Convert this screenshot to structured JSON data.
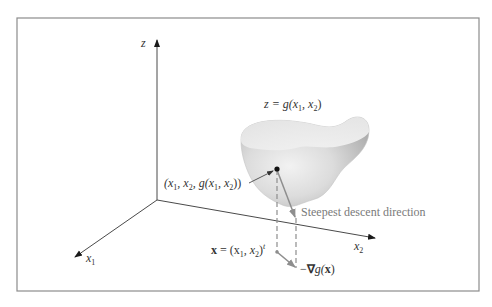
{
  "figure": {
    "frame_color": "#8c8c8c",
    "axis_color": "#4a4a4a",
    "accent_gray": "#8e8e8e",
    "axes": {
      "z_label": "z",
      "x1_label": "x",
      "x1_sub": "1",
      "x2_label": "x",
      "x2_sub": "2"
    },
    "surface_label": {
      "lhs": "z = g(x",
      "sub1": "1",
      "mid": ", x",
      "sub2": "2",
      "end": ")"
    },
    "point_label": {
      "p1": "(x",
      "s1": "1",
      "p2": ", x",
      "s2": "2",
      "p3": ", g(x",
      "s3": "1",
      "p4": ", x",
      "s4": "2",
      "p5": "))"
    },
    "descent_label": "Steepest descent direction",
    "x_vector_label": {
      "bold": "x",
      "eq": " = (x",
      "s1": "1",
      "mid": ", x",
      "s2": "2",
      "close": ")",
      "sup": "t"
    },
    "neg_gradient_label": {
      "minus": "−",
      "nabla": "∇",
      "g": "g(",
      "x": "x",
      "close": ")"
    }
  }
}
